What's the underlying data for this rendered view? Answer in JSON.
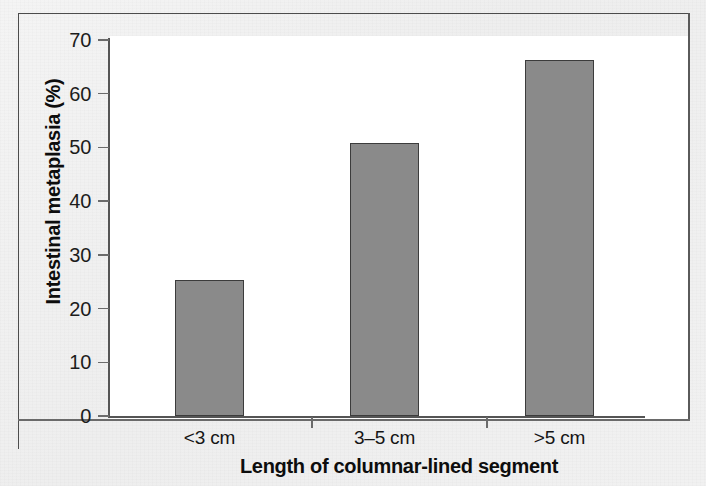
{
  "figure": {
    "background_color": "#f1f1f1",
    "plot_background_color": "#ffffff",
    "frame_color": "#4c4c4c"
  },
  "chart_data": {
    "type": "bar",
    "title": "",
    "subtitle": "",
    "categories": [
      "<3 cm",
      "3–5 cm",
      ">5 cm"
    ],
    "values": [
      25.3,
      50.9,
      66.2
    ],
    "series": [
      {
        "name": "Intestinal metaplasia",
        "values": [
          25.3,
          50.9,
          66.2
        ],
        "color": "#8a8a8a",
        "edge_color": "#3c3c3c"
      }
    ],
    "xlabel": "Length of columnar-lined segment",
    "ylabel": "Intestinal metaplasia (%)",
    "ylim": [
      0,
      70
    ],
    "yticks": [
      0,
      10,
      20,
      30,
      40,
      50,
      60,
      70
    ],
    "ytick_labels": [
      "0",
      "10",
      "20",
      "30",
      "40",
      "50",
      "60",
      "70"
    ],
    "xtick_labels": [
      "<3 cm",
      "3–5 cm",
      ">5 cm"
    ],
    "grid": false,
    "legend": null,
    "annotations": []
  }
}
